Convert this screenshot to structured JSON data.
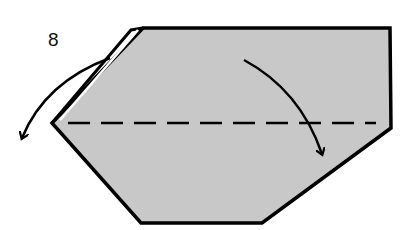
{
  "diagram": {
    "step_number": "8",
    "fill_color": "#c8c8c8",
    "stroke_color": "#000000",
    "shape": {
      "type": "paper-polygon",
      "points": [
        [
          143,
          28
        ],
        [
          390,
          28
        ],
        [
          391,
          128
        ],
        [
          262,
          223
        ],
        [
          141,
          223
        ],
        [
          52,
          123
        ]
      ]
    },
    "flap": {
      "points": [
        [
          52,
          123
        ],
        [
          131,
          30
        ],
        [
          143,
          28
        ]
      ]
    },
    "fold_line": {
      "style": "dashed",
      "y": 123,
      "x1": 68,
      "x2": 375
    },
    "arrows": [
      {
        "name": "valley-fold-arrow",
        "direction": "down",
        "from": [
          245,
          60
        ],
        "to": [
          322,
          155
        ]
      },
      {
        "name": "flap-unfold-arrow",
        "direction": "left-down",
        "from": [
          112,
          58
        ],
        "to": [
          22,
          140
        ]
      }
    ]
  }
}
